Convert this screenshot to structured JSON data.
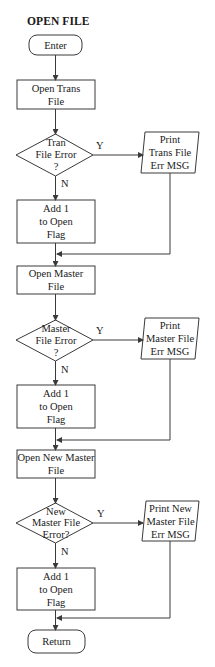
{
  "title": "OPEN FILE",
  "nodes": {
    "enter": "Enter",
    "open_trans": "Open Trans\nFile",
    "trans_decision": "Tran\nFile Error\n?",
    "print_trans": "Print\nTrans File\nErr MSG",
    "add1_a": "Add 1\nto Open\nFlag",
    "open_master": "Open Master\nFile",
    "master_decision": "Master\nFile Error\n?",
    "print_master": "Print\nMaster File\nErr MSG",
    "add1_b": "Add 1\nto Open\nFlag",
    "open_new_master": "Open New Master\nFile",
    "new_master_decision": "New\nMaster File\nError?",
    "print_new_master": "Print New\nMaster File\nErr MSG",
    "add1_c": "Add 1\nto Open\nFlag",
    "return": "Return"
  },
  "branch_labels": {
    "yes": "Y",
    "no": "N"
  },
  "colors": {
    "stroke": "#3a3a3a",
    "background": "#ffffff"
  }
}
